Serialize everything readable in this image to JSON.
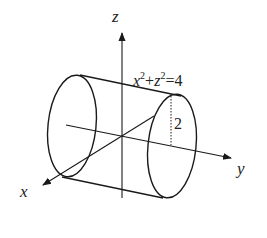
{
  "diagram": {
    "type": "3d-cylinder-axes",
    "axes": {
      "z_label": "z",
      "y_label": "y",
      "x_label": "x"
    },
    "equation": {
      "var1": "x",
      "exp1": "2",
      "plus": "+",
      "var2": "z",
      "exp2": "2",
      "equals_value": "=4"
    },
    "radius_label": "2",
    "colors": {
      "stroke": "#1a1a1a",
      "background": "#ffffff"
    }
  }
}
